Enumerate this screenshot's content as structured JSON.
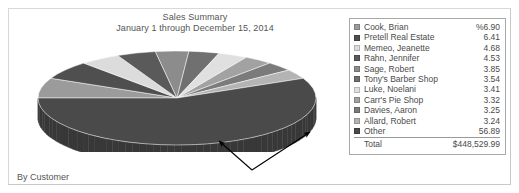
{
  "report": {
    "title": "Sales Summary",
    "subtitle": "January 1 through December 15, 2014",
    "footer_label": "By Customer"
  },
  "legend": {
    "total_label": "Total",
    "total_value": "$448,529.99"
  },
  "chart_data": {
    "type": "pie",
    "title": "Sales Summary",
    "subtitle": "January 1 through December 15, 2014",
    "xlabel": "",
    "ylabel": "",
    "value_unit": "percent",
    "total_label": "Total",
    "total_value": "$448,529.99",
    "legend_position": "right",
    "three_d": true,
    "categories": [
      "Cook, Brian",
      "Pretell Real Estate",
      "Memeo, Jeanette",
      "Rahn, Jennifer",
      "Sage, Robert",
      "Tony's Barber Shop",
      "Luke, Noelani",
      "Carr's Pie Shop",
      "Davies, Aaron",
      "Allard, Robert",
      "Other"
    ],
    "values": [
      6.9,
      6.41,
      4.68,
      4.53,
      3.85,
      3.54,
      3.41,
      3.32,
      3.25,
      3.24,
      56.89
    ],
    "value_labels": [
      "%6.90",
      "6.41",
      "4.68",
      "4.53",
      "3.85",
      "3.54",
      "3.41",
      "3.32",
      "3.25",
      "3.24",
      "56.89"
    ],
    "colors": [
      "#9b9b9b",
      "#4f4f4f",
      "#dcdcdc",
      "#5a5a5a",
      "#8c8c8c",
      "#707070",
      "#e0e0e0",
      "#a2a2a2",
      "#7b7b7b",
      "#b4b4b4",
      "#4a4a4a"
    ],
    "side_colors": [
      "#6f6f6f",
      "#3a3a3a",
      "#a9a9a9",
      "#414141",
      "#666666",
      "#525252",
      "#adadad",
      "#767676",
      "#585858",
      "#848484",
      "#383838"
    ]
  },
  "annotations": {
    "arrow_left_name": "callout-arrow-left",
    "arrow_right_name": "callout-arrow-right"
  }
}
